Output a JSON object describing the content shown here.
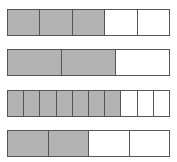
{
  "colors": {
    "filled": "#b3b3b3",
    "empty": "#ffffff",
    "stroke": "#555555"
  },
  "bars": [
    {
      "parts": 5,
      "shaded": 3,
      "top": 9
    },
    {
      "parts": 3,
      "shaded": 2,
      "top": 49
    },
    {
      "parts": 10,
      "shaded": 7,
      "top": 90
    },
    {
      "parts": 4,
      "shaded": 2,
      "top": 130
    }
  ]
}
